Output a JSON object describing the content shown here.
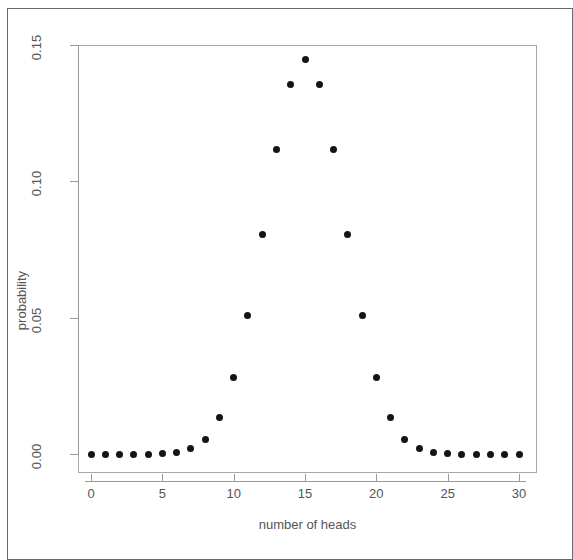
{
  "chart_data": {
    "type": "scatter",
    "title": "",
    "subtitle": "",
    "xlabel": "number of heads",
    "ylabel": "probability",
    "xlim": [
      -0.9,
      30.9
    ],
    "ylim": [
      0.0,
      0.152
    ],
    "grid": false,
    "legend": null,
    "annotations": [],
    "x_ticks": [
      0,
      5,
      10,
      15,
      20,
      25,
      30
    ],
    "x_tick_labels": [
      "0",
      "5",
      "10",
      "15",
      "20",
      "25",
      "30"
    ],
    "y_ticks": [
      0.0,
      0.05,
      0.1,
      0.15
    ],
    "y_tick_labels": [
      "0.00",
      "0.05",
      "0.10",
      "0.15"
    ],
    "marker": "filled-circle",
    "marker_color": "#141414",
    "x": [
      0,
      1,
      2,
      3,
      4,
      5,
      6,
      7,
      8,
      9,
      10,
      11,
      12,
      13,
      14,
      15,
      16,
      17,
      18,
      19,
      20,
      21,
      22,
      23,
      24,
      25,
      26,
      27,
      28,
      29,
      30
    ],
    "y": [
      0.0,
      0.0,
      0.0,
      0.0,
      0.0,
      0.0001,
      0.0006,
      0.0019,
      0.0055,
      0.0133,
      0.028,
      0.0509,
      0.0806,
      0.1115,
      0.1354,
      0.1445,
      0.1354,
      0.1115,
      0.0806,
      0.0509,
      0.028,
      0.0133,
      0.0055,
      0.0019,
      0.0006,
      0.0001,
      0.0,
      0.0,
      0.0,
      0.0,
      0.0
    ]
  },
  "figure": {
    "x_axis_title": "number of heads",
    "y_axis_title": "probability"
  },
  "colors": {
    "marker": "#141414",
    "axis": "#9a9a9a",
    "frame": "#a8a8a8",
    "page_border": "#6a6a6a",
    "text": "#555555",
    "background": "#ffffff"
  }
}
